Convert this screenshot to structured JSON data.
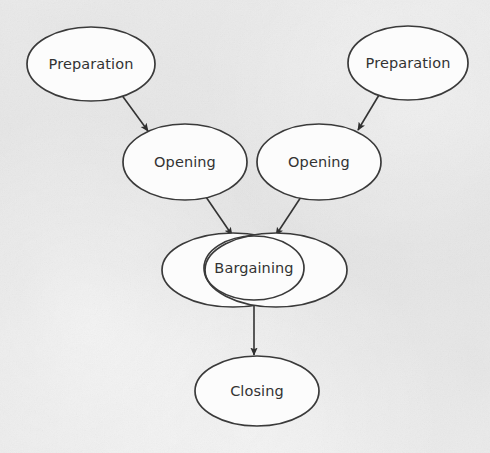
{
  "diagram": {
    "type": "flow-diagram",
    "background_color": "#e6e6e6",
    "node_fill_color": "#fcfcfc",
    "node_stroke_color": "#3a3a3a",
    "text_color": "#333333",
    "arrow_color": "#2e2e2e",
    "nodes": [
      {
        "id": "preparation-left",
        "label": "Preparation",
        "shape": "ellipse",
        "cx": 91,
        "cy": 64,
        "rx": 64,
        "ry": 37
      },
      {
        "id": "preparation-right",
        "label": "Preparation",
        "shape": "ellipse",
        "cx": 408,
        "cy": 63,
        "rx": 60,
        "ry": 37
      },
      {
        "id": "opening-left",
        "label": "Opening",
        "shape": "ellipse",
        "cx": 185,
        "cy": 162,
        "rx": 62,
        "ry": 38
      },
      {
        "id": "opening-right",
        "label": "Opening",
        "shape": "ellipse",
        "cx": 319,
        "cy": 162,
        "rx": 62,
        "ry": 38
      },
      {
        "id": "bargaining-outer-left",
        "label": "",
        "shape": "ellipse",
        "cx": 233,
        "cy": 270,
        "rx": 71,
        "ry": 37
      },
      {
        "id": "bargaining-outer-right",
        "label": "",
        "shape": "ellipse",
        "cx": 276,
        "cy": 270,
        "rx": 71,
        "ry": 37
      },
      {
        "id": "bargaining",
        "label": "Bargaining",
        "shape": "ellipse",
        "cx": 254,
        "cy": 268,
        "rx": 50,
        "ry": 32
      },
      {
        "id": "closing",
        "label": "Closing",
        "shape": "ellipse",
        "cx": 257,
        "cy": 391,
        "rx": 62,
        "ry": 35
      }
    ],
    "edges": [
      {
        "id": "edge-preparation-left-to-opening-left",
        "from": "preparation-left",
        "to": "opening-left",
        "label": "",
        "x1": 121,
        "y1": 94,
        "x2": 148,
        "y2": 131
      },
      {
        "id": "edge-preparation-right-to-opening-right",
        "from": "preparation-right",
        "to": "opening-right",
        "label": "",
        "x1": 379,
        "y1": 95,
        "x2": 358,
        "y2": 130
      },
      {
        "id": "edge-opening-left-to-bargaining",
        "from": "opening-left",
        "to": "bargaining",
        "label": "",
        "x1": 206,
        "y1": 197,
        "x2": 232,
        "y2": 235
      },
      {
        "id": "edge-opening-right-to-bargaining",
        "from": "opening-right",
        "to": "bargaining",
        "label": "",
        "x1": 301,
        "y1": 197,
        "x2": 276,
        "y2": 235
      },
      {
        "id": "edge-bargaining-to-closing",
        "from": "bargaining",
        "to": "closing",
        "label": "",
        "x1": 254,
        "y1": 305,
        "x2": 254,
        "y2": 355
      }
    ]
  }
}
